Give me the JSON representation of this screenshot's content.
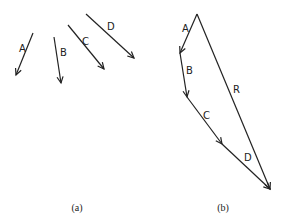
{
  "panels": [
    {
      "caption": "(a)",
      "caption_pos": [
        77,
        211
      ],
      "vectors": [
        {
          "label": "A",
          "from": [
            33,
            33
          ],
          "to": [
            16,
            75
          ],
          "label_pos": [
            19,
            52
          ]
        },
        {
          "label": "B",
          "from": [
            54,
            37
          ],
          "to": [
            61,
            83
          ],
          "label_pos": [
            60,
            56
          ]
        },
        {
          "label": "C",
          "from": [
            68,
            25
          ],
          "to": [
            104,
            69
          ],
          "label_pos": [
            82,
            45
          ]
        },
        {
          "label": "D",
          "from": [
            86,
            14
          ],
          "to": [
            134,
            58
          ],
          "label_pos": [
            107,
            30
          ]
        }
      ]
    },
    {
      "caption": "(b)",
      "caption_pos": [
        223,
        211
      ],
      "vectors": [
        {
          "label": "A",
          "from": [
            197,
            14
          ],
          "to": [
            180,
            53
          ],
          "label_pos": [
            182,
            32
          ]
        },
        {
          "label": "B",
          "from": [
            180,
            53
          ],
          "to": [
            187,
            97
          ],
          "label_pos": [
            186,
            74
          ]
        },
        {
          "label": "C",
          "from": [
            187,
            97
          ],
          "to": [
            222,
            144
          ],
          "label_pos": [
            203,
            119
          ]
        },
        {
          "label": "D",
          "from": [
            222,
            144
          ],
          "to": [
            270,
            189
          ],
          "label_pos": [
            244,
            161
          ]
        },
        {
          "label": "R",
          "from": [
            197,
            14
          ],
          "to": [
            270,
            189
          ],
          "label_pos": [
            233,
            93
          ]
        }
      ]
    }
  ]
}
